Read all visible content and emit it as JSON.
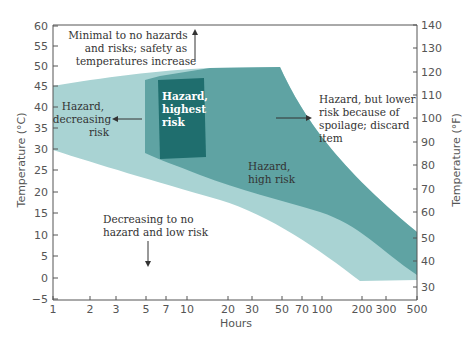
{
  "chart_data": {
    "type": "area",
    "title": "",
    "xlabel": "Hours",
    "ylabel_left": "Temperature (°C)",
    "ylabel_right": "Temperature (°F)",
    "x_scale": "log",
    "xlim": [
      1,
      500
    ],
    "ylim_celsius": [
      -5,
      60
    ],
    "ylim_fahrenheit": [
      30,
      140
    ],
    "x_ticks": [
      "1",
      "2",
      "3",
      "5",
      "7",
      "10",
      "20",
      "30",
      "50",
      "70",
      "100",
      "200",
      "300",
      "500"
    ],
    "y_ticks_left": [
      "60",
      "55",
      "50",
      "45",
      "40",
      "35",
      "30",
      "25",
      "20",
      "15",
      "10",
      "5",
      "0",
      "−5"
    ],
    "y_ticks_right": [
      "140",
      "130",
      "120",
      "110",
      "100",
      "90",
      "80",
      "70",
      "60",
      "50",
      "40",
      "30"
    ],
    "grid": false,
    "legend": null,
    "regions": [
      {
        "name": "Hazard, decreasing risk (outer band)",
        "color": "#a9d3d3",
        "upper_bound_celsius": [
          [
            1,
            45
          ],
          [
            10,
            48
          ],
          [
            30,
            50
          ],
          [
            50,
            43
          ],
          [
            100,
            28
          ],
          [
            200,
            20
          ],
          [
            500,
            4
          ]
        ],
        "lower_bound_celsius": [
          [
            1,
            30
          ],
          [
            10,
            25
          ],
          [
            30,
            19
          ],
          [
            100,
            9
          ],
          [
            200,
            1
          ],
          [
            500,
            1
          ]
        ]
      },
      {
        "name": "Hazard, high risk",
        "color": "#5fa3a3",
        "upper_bound_celsius": [
          [
            5,
            47
          ],
          [
            10,
            49
          ],
          [
            30,
            50
          ],
          [
            50,
            43
          ],
          [
            100,
            28
          ],
          [
            200,
            20
          ],
          [
            500,
            10
          ]
        ],
        "lower_bound_celsius": [
          [
            5,
            36
          ],
          [
            10,
            31
          ],
          [
            30,
            25
          ],
          [
            100,
            15
          ],
          [
            200,
            8
          ],
          [
            500,
            0
          ]
        ]
      },
      {
        "name": "Hazard, highest risk",
        "color": "#1f6e6e",
        "upper_bound_celsius": [
          [
            6,
            47
          ],
          [
            12,
            47
          ]
        ],
        "lower_bound_celsius": [
          [
            6,
            30
          ],
          [
            12,
            29
          ]
        ]
      }
    ],
    "annotations": [
      {
        "text": "Minimal to no hazards and risks; safety as temperatures increase",
        "arrow": "up"
      },
      {
        "text": "Hazard, decreasing risk",
        "arrow": "left"
      },
      {
        "text": "Hazard, highest risk",
        "arrow": null
      },
      {
        "text": "Hazard, but lower risk because of spoilage; discard item",
        "arrow": "from-left"
      },
      {
        "text": "Hazard, high risk",
        "arrow": null
      },
      {
        "text": "Decreasing to no hazard and low risk",
        "arrow": "down"
      }
    ]
  },
  "labels": {
    "xlabel": "Hours",
    "ylabel_left": "Temperature (°C)",
    "ylabel_right": "Temperature (°F)",
    "minimal_1": "Minimal to no hazards",
    "minimal_2": "and risks; safety as",
    "minimal_3": "temperatures increase",
    "decreasing_1": "Hazard,",
    "decreasing_2": "decreasing",
    "decreasing_3": "risk",
    "highest_1": "Hazard,",
    "highest_2": "highest",
    "highest_3": "risk",
    "spoil_1": "Hazard, but lower",
    "spoil_2": "risk because of",
    "spoil_3": "spoilage; discard",
    "spoil_4": "item",
    "high_1": "Hazard,",
    "high_2": "high risk",
    "low_1": "Decreasing to no",
    "low_2": "hazard and low risk"
  },
  "ticks": {
    "x": [
      {
        "label": "1",
        "x": 53
      },
      {
        "label": "2",
        "x": 90
      },
      {
        "label": "3",
        "x": 116
      },
      {
        "label": "5",
        "x": 146
      },
      {
        "label": "7",
        "x": 166
      },
      {
        "label": "10",
        "x": 187
      },
      {
        "label": "20",
        "x": 228
      },
      {
        "label": "30",
        "x": 252
      },
      {
        "label": "50",
        "x": 282
      },
      {
        "label": "70",
        "x": 302
      },
      {
        "label": "100",
        "x": 322
      },
      {
        "label": "200",
        "x": 362
      },
      {
        "label": "300",
        "x": 386
      },
      {
        "label": "500",
        "x": 417
      }
    ],
    "yl": [
      {
        "label": "60",
        "y": 26
      },
      {
        "label": "55",
        "y": 46
      },
      {
        "label": "50",
        "y": 66
      },
      {
        "label": "45",
        "y": 86
      },
      {
        "label": "40",
        "y": 107
      },
      {
        "label": "35",
        "y": 128
      },
      {
        "label": "30",
        "y": 149
      },
      {
        "label": "25",
        "y": 170
      },
      {
        "label": "20",
        "y": 192
      },
      {
        "label": "15",
        "y": 213
      },
      {
        "label": "10",
        "y": 235
      },
      {
        "label": "5",
        "y": 256
      },
      {
        "label": "0",
        "y": 278
      },
      {
        "label": "−5",
        "y": 299
      }
    ],
    "yr": [
      {
        "label": "140",
        "y": 25
      },
      {
        "label": "130",
        "y": 48
      },
      {
        "label": "120",
        "y": 72
      },
      {
        "label": "110",
        "y": 95
      },
      {
        "label": "100",
        "y": 118
      },
      {
        "label": "90",
        "y": 142
      },
      {
        "label": "80",
        "y": 165
      },
      {
        "label": "70",
        "y": 189
      },
      {
        "label": "60",
        "y": 212
      },
      {
        "label": "50",
        "y": 238
      },
      {
        "label": "40",
        "y": 261
      },
      {
        "label": "30",
        "y": 287
      }
    ]
  }
}
